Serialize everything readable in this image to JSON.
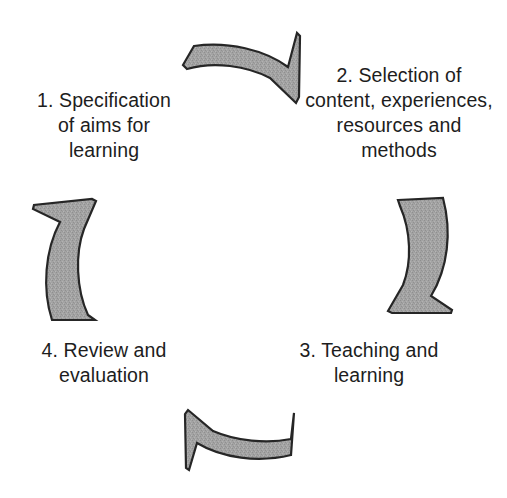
{
  "diagram": {
    "type": "cycle-diagram",
    "background_color": "#ffffff",
    "arrow_fill_color": "#a0a0a0",
    "arrow_outline_color": "#262626",
    "text_color": "#1d1d1d",
    "stages": [
      {
        "number": "1.",
        "label": "1. Specification\nof aims for\nlearning",
        "position": "top-left"
      },
      {
        "number": "2.",
        "label": "2. Selection of\ncontent, experiences,\nresources and\nmethods",
        "position": "top-right"
      },
      {
        "number": "3.",
        "label": "3. Teaching and\nlearning",
        "position": "bottom-right"
      },
      {
        "number": "4.",
        "label": "4. Review and\nevaluation",
        "position": "bottom-left"
      }
    ],
    "arrows": [
      {
        "name": "arrow-top",
        "direction": "right",
        "from_stage": "1",
        "to_stage": "2"
      },
      {
        "name": "arrow-right",
        "direction": "down",
        "from_stage": "2",
        "to_stage": "3"
      },
      {
        "name": "arrow-bottom",
        "direction": "left",
        "from_stage": "3",
        "to_stage": "4"
      },
      {
        "name": "arrow-left",
        "direction": "up",
        "from_stage": "4",
        "to_stage": "1"
      }
    ]
  }
}
